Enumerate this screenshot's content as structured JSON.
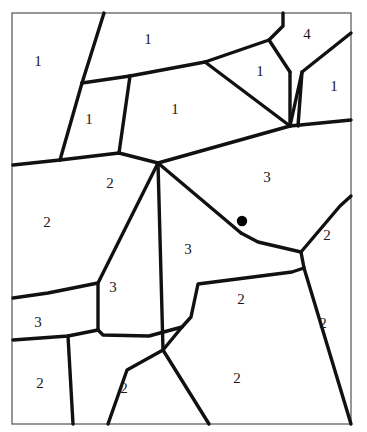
{
  "figure": {
    "name": "planar-subdivision-diagram",
    "background_color": "#ffffff",
    "stroke_color": "#111111",
    "frame": {
      "color": "#6b6b6b",
      "stroke_width": 1.4,
      "x": 12,
      "y": 13,
      "width": 339,
      "height": 411
    },
    "edge_stroke_width": 3.4,
    "marker": {
      "name": "black-dot",
      "shape": "filled-circle",
      "color": "#000000",
      "cx": 242,
      "cy": 221,
      "r": 5.2
    }
  },
  "edges": [
    {
      "id": "e1",
      "points": "104,13 82,83"
    },
    {
      "id": "e2",
      "points": "82,83 60,160"
    },
    {
      "id": "e3",
      "points": "82,83 130,76"
    },
    {
      "id": "e4",
      "points": "130,76 205,62"
    },
    {
      "id": "e5",
      "points": "205,62 269,40"
    },
    {
      "id": "e6",
      "points": "269,40 283,26 283,13"
    },
    {
      "id": "e7",
      "points": "269,40 290,72"
    },
    {
      "id": "e8",
      "points": "290,72 290,126"
    },
    {
      "id": "e9",
      "points": "290,126 302,72 351,33"
    },
    {
      "id": "e10",
      "points": "302,72 298,126"
    },
    {
      "id": "e11",
      "points": "205,62 290,126"
    },
    {
      "id": "e12",
      "points": "130,76 119,153"
    },
    {
      "id": "e13",
      "points": "119,153 60,160"
    },
    {
      "id": "e14",
      "points": "60,160 13,165"
    },
    {
      "id": "e15",
      "points": "119,153 158,163"
    },
    {
      "id": "e16",
      "points": "158,163 290,126"
    },
    {
      "id": "e17",
      "points": "290,126 351,120"
    },
    {
      "id": "e18",
      "points": "158,163 98,283 98,330"
    },
    {
      "id": "e19",
      "points": "158,163 163,350"
    },
    {
      "id": "e20",
      "points": "158,163 241,233"
    },
    {
      "id": "e21",
      "points": "241,233 258,242 301,252"
    },
    {
      "id": "e22",
      "points": "301,252 340,206 351,196"
    },
    {
      "id": "e23",
      "points": "301,252 304,268"
    },
    {
      "id": "e24",
      "points": "304,268 292,272 198,284 191,317 182,327"
    },
    {
      "id": "e25",
      "points": "182,327 163,350"
    },
    {
      "id": "e26",
      "points": "304,268 351,424"
    },
    {
      "id": "e27",
      "points": "163,350 127,370 108,424"
    },
    {
      "id": "e28",
      "points": "182,327 149,336 103,335 98,330"
    },
    {
      "id": "e29",
      "points": "98,330 68,336 13,340"
    },
    {
      "id": "e30",
      "points": "68,336 73,424"
    },
    {
      "id": "e31",
      "points": "98,283 48,293 13,298"
    },
    {
      "id": "e32",
      "points": "163,350 209,424"
    }
  ],
  "labels": [
    {
      "name": "cell-label-1a",
      "text": "1",
      "x": 38,
      "y": 63
    },
    {
      "name": "cell-label-1b",
      "text": "1",
      "x": 148,
      "y": 41
    },
    {
      "name": "cell-label-4",
      "text": "4",
      "x": 307,
      "y": 36
    },
    {
      "name": "cell-label-1c",
      "text": "1",
      "x": 260,
      "y": 73
    },
    {
      "name": "cell-label-1d",
      "text": "1",
      "x": 334,
      "y": 88
    },
    {
      "name": "cell-label-1e",
      "text": "1",
      "x": 89,
      "y": 121
    },
    {
      "name": "cell-label-1f",
      "text": "1",
      "x": 175,
      "y": 111
    },
    {
      "name": "cell-label-2a",
      "text": "2",
      "x": 110,
      "y": 185
    },
    {
      "name": "cell-label-3a",
      "text": "3",
      "x": 267,
      "y": 179
    },
    {
      "name": "cell-label-2b",
      "text": "2",
      "x": 47,
      "y": 224
    },
    {
      "name": "cell-label-2c",
      "text": "2",
      "x": 327,
      "y": 237
    },
    {
      "name": "cell-label-3b",
      "text": "3",
      "x": 188,
      "y": 251
    },
    {
      "name": "cell-label-3c",
      "text": "3",
      "x": 113,
      "y": 289
    },
    {
      "name": "cell-label-2d",
      "text": "2",
      "x": 241,
      "y": 301
    },
    {
      "name": "cell-label-3d",
      "text": "3",
      "x": 38,
      "y": 324
    },
    {
      "name": "cell-label-2e",
      "text": "2",
      "x": 323,
      "y": 325
    },
    {
      "name": "cell-label-2f",
      "text": "2",
      "x": 40,
      "y": 385
    },
    {
      "name": "cell-label-2g",
      "text": "2",
      "x": 124,
      "y": 390
    },
    {
      "name": "cell-label-2h",
      "text": "2",
      "x": 237,
      "y": 380
    }
  ]
}
